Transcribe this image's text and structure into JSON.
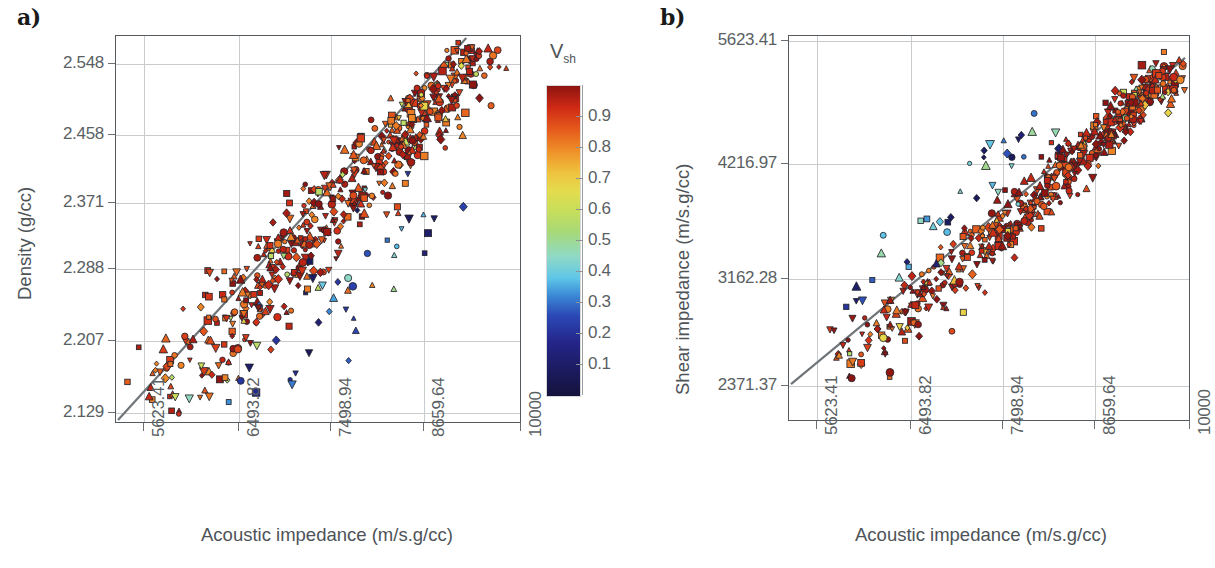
{
  "figure": {
    "panel_a_letter": "a)",
    "panel_b_letter": "b)"
  },
  "colorbar": {
    "title": "V",
    "title_sub": "sh",
    "name": "Vsh",
    "ticks": [
      "0.9",
      "0.8",
      "0.7",
      "0.6",
      "0.5",
      "0.4",
      "0.3",
      "0.2",
      "0.1"
    ],
    "tick_values": [
      0.9,
      0.8,
      0.7,
      0.6,
      0.5,
      0.4,
      0.3,
      0.2,
      0.1
    ],
    "range": [
      0.0,
      1.0
    ],
    "colors_low_to_high": [
      "#14123c",
      "#242488",
      "#2b49b6",
      "#5fc6e8",
      "#8fd9c6",
      "#a8d977",
      "#e3dc4e",
      "#efc33e",
      "#ef9028",
      "#cf2a15",
      "#8d1410"
    ]
  },
  "chart_data": [
    {
      "id": "panel-a",
      "type": "scatter",
      "title": "a)",
      "xlabel": "Acoustic impedance (m/s.g/cc)",
      "ylabel": "Density (g/cc)",
      "xscale": "log",
      "yscale": "log",
      "xticks": [
        "5623.41",
        "6493.82",
        "7498.94",
        "8659.64",
        "10000"
      ],
      "xtick_values": [
        5623.41,
        6493.82,
        7498.94,
        8659.64,
        10000
      ],
      "yticks": [
        "2.548",
        "2.458",
        "2.371",
        "2.288",
        "2.207",
        "2.129"
      ],
      "ytick_values": [
        2.548,
        2.458,
        2.371,
        2.288,
        2.207,
        2.129
      ],
      "xlim": [
        5247,
        10000
      ],
      "ylim": [
        2.129,
        2.592
      ],
      "grid": true,
      "colorby": "Vsh",
      "reference_line": {
        "label": "1:1 trend",
        "from_xy": [
          5247,
          2.129
        ],
        "to_xy": [
          9380,
          2.592
        ]
      },
      "marker_shapes": [
        "square",
        "triangle-up",
        "triangle-down",
        "circle",
        "diamond"
      ],
      "n_points": 620,
      "annotations": []
    },
    {
      "id": "panel-b",
      "type": "scatter",
      "title": "b)",
      "xlabel": "Acoustic impedance (m/s.g/cc)",
      "ylabel": "Shear impedance (m/s.g/cc)",
      "xscale": "log",
      "yscale": "log",
      "xticks": [
        "5623.41",
        "6493.82",
        "7498.94",
        "8659.64",
        "10000"
      ],
      "xtick_values": [
        5623.41,
        6493.82,
        7498.94,
        8659.64,
        10000
      ],
      "yticks": [
        "5623.41",
        "4216.97",
        "3162.28",
        "2371.37"
      ],
      "ytick_values": [
        5623.41,
        4216.97,
        3162.28,
        2371.37
      ],
      "xlim": [
        5247,
        10000
      ],
      "ylim": [
        2230,
        5900
      ],
      "grid": true,
      "colorby": "Vsh",
      "reference_line": {
        "label": "1:1 trend",
        "from_xy": [
          5247,
          2371.37
        ],
        "to_xy": [
          10000,
          5760
        ]
      },
      "marker_shapes": [
        "square",
        "triangle-up",
        "triangle-down",
        "circle",
        "diamond"
      ],
      "n_points": 620,
      "annotations": []
    }
  ],
  "panel_a": {
    "ylabel": "Density (g/cc)",
    "xlabel": "Acoustic impedance (m/s.g/cc)",
    "yticks": [
      "2.548",
      "2.458",
      "2.371",
      "2.288",
      "2.207",
      "2.129"
    ],
    "xticks": [
      "5623.41",
      "6493.82",
      "7498.94",
      "8659.64",
      "10000"
    ]
  },
  "panel_b": {
    "ylabel": "Shear impedance (m/s.g/cc)",
    "xlabel": "Acoustic impedance (m/s.g/cc)",
    "yticks": [
      "5623.41",
      "4216.97",
      "3162.28",
      "2371.37"
    ],
    "xticks": [
      "5623.41",
      "6493.82",
      "7498.94",
      "8659.64",
      "10000"
    ]
  },
  "caption": {
    "text": ""
  }
}
